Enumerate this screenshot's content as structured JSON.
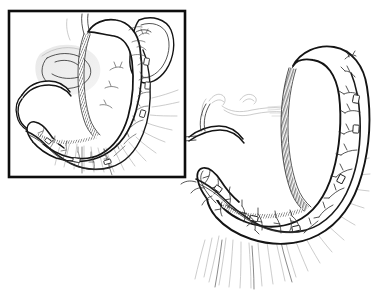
{
  "figure": {
    "title": "Sleeve gastrectomy with preserved gastroepiploic arcade",
    "caption": "",
    "width": 381,
    "height": 296,
    "background_color": "#ffffff",
    "ink_color": "#1a1a1a",
    "ghost_color": "#b6b6b6",
    "style": "pen-and-ink medical line drawing"
  },
  "inset": {
    "name": "context-inset-panel",
    "frame": {
      "x": 9,
      "y": 11,
      "width": 176,
      "height": 166,
      "stroke_color": "#0d0d0d",
      "stroke_width": 2.6
    },
    "label": "",
    "structures": [
      {
        "name": "gastric-sleeve",
        "label": "Gastric sleeve"
      },
      {
        "name": "staple-line",
        "label": "Staple line"
      },
      {
        "name": "spleen",
        "label": "Spleen"
      },
      {
        "name": "pancreas",
        "label": "Pancreas"
      },
      {
        "name": "duodenum",
        "label": "Duodenum"
      },
      {
        "name": "gastroepiploic-arcade",
        "label": "Gastroepiploic arcade"
      },
      {
        "name": "greater-omentum",
        "label": "Greater omentum"
      }
    ]
  },
  "main": {
    "name": "main-illustration",
    "structures": [
      {
        "name": "gastric-sleeve",
        "label": "Gastric sleeve"
      },
      {
        "name": "staple-line",
        "label": "Staple line"
      },
      {
        "name": "fundus",
        "label": "Fundus"
      },
      {
        "name": "antrum",
        "label": "Antrum"
      },
      {
        "name": "pylorus",
        "label": "Pylorus"
      },
      {
        "name": "duodenum",
        "label": "Duodenum"
      },
      {
        "name": "gastroepiploic-arcade",
        "label": "Gastroepiploic arcade"
      },
      {
        "name": "vascular-branches",
        "label": "Vascular branches"
      },
      {
        "name": "greater-omentum",
        "label": "Greater omentum"
      },
      {
        "name": "hepatic-vessels",
        "label": "Hepatic vessels"
      }
    ]
  },
  "annotations": {
    "leader_lines": [],
    "text_labels": []
  }
}
